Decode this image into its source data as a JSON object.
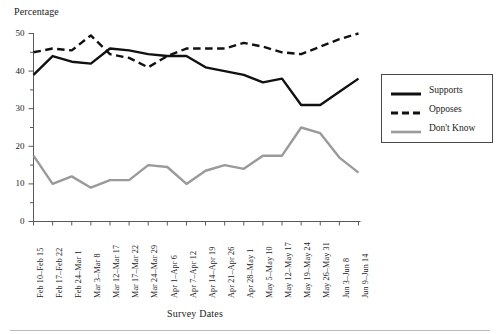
{
  "chart_data": {
    "type": "line",
    "title": "",
    "xlabel": "Survey Dates",
    "ylabel": "Percentage",
    "ylim": [
      0,
      50
    ],
    "yticks": [
      0,
      10,
      20,
      30,
      40,
      50
    ],
    "yminor_step": 5,
    "grid": false,
    "legend_position": "right-outside",
    "categories": [
      "Feb 10–Feb 15",
      "Feb 17–Feb 22",
      "Feb 24–Mar 1",
      "Mar 3–Mar 8",
      "Mar 12–Mar 17",
      "Mar 17–Mar 22",
      "Mar 24–Mar 29",
      "Apr 1–Apr 6",
      "Apr 7–Apr 12",
      "Apr 14–Apr 19",
      "Apr 21–Apr 26",
      "Apr 28–May 1",
      "May 5–May 10",
      "May 12–May 17",
      "May 19–May 24",
      "May 26–May 31",
      "Jun 3–Jun 8",
      "Jun 9–Jun 14"
    ],
    "series": [
      {
        "name": "Supports",
        "color": "#111111",
        "style": "solid",
        "width": 2.4,
        "values": [
          39,
          44,
          42.5,
          42,
          46,
          45.5,
          44.5,
          44,
          44,
          41,
          40,
          39,
          37,
          38,
          31,
          31,
          34.5,
          38
        ]
      },
      {
        "name": "Opposes",
        "color": "#111111",
        "style": "dashed",
        "width": 2.4,
        "values": [
          45,
          46,
          45.5,
          49.5,
          44.5,
          43.5,
          41,
          44,
          46,
          46,
          46,
          47.5,
          46.5,
          45,
          44.5,
          46.5,
          48.5,
          50
        ]
      },
      {
        "name": "Don't Know",
        "color": "#9a9a9a",
        "style": "solid",
        "width": 2.4,
        "values": [
          17.5,
          10,
          12,
          9,
          11,
          11,
          15,
          14.5,
          10,
          13.5,
          15,
          14,
          17.5,
          17.5,
          25,
          23.5,
          17,
          13
        ]
      }
    ]
  },
  "axis": {
    "y_title": "Percentage",
    "x_title": "Survey Dates",
    "y_tick_labels": [
      "50",
      "40",
      "30",
      "20",
      "10",
      "0"
    ]
  },
  "legend": {
    "entries": [
      {
        "label": "Supports"
      },
      {
        "label": "Opposes"
      },
      {
        "label": "Don't Know"
      }
    ]
  }
}
